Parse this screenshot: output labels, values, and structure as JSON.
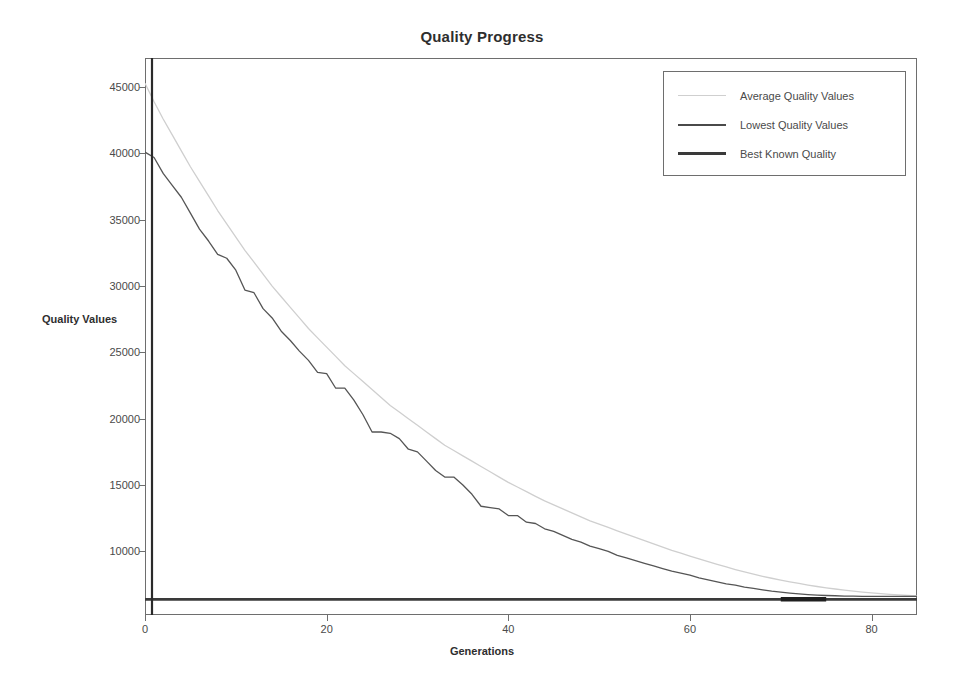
{
  "chart_data": {
    "type": "line",
    "title": "Quality Progress",
    "xlabel": "Generations",
    "ylabel": "Quality Values",
    "xlim": [
      0,
      85
    ],
    "ylim": [
      5200,
      47200
    ],
    "grid": false,
    "legend_position": "top-right",
    "xticks": [
      0,
      20,
      40,
      60,
      80
    ],
    "xtick_labels": [
      "0",
      "20",
      "40",
      "60",
      "80"
    ],
    "yticks": [
      10000,
      15000,
      20000,
      25000,
      30000,
      35000,
      40000,
      45000
    ],
    "ytick_labels": [
      "10000",
      "15000",
      "20000",
      "25000",
      "30000",
      "35000",
      "40000",
      "45000"
    ],
    "x": [
      0,
      1,
      2,
      3,
      4,
      5,
      6,
      7,
      8,
      9,
      10,
      11,
      12,
      13,
      14,
      15,
      16,
      17,
      18,
      19,
      20,
      21,
      22,
      23,
      24,
      25,
      26,
      27,
      28,
      29,
      30,
      31,
      32,
      33,
      34,
      35,
      36,
      37,
      38,
      39,
      40,
      41,
      42,
      43,
      44,
      45,
      46,
      47,
      48,
      49,
      50,
      51,
      52,
      53,
      54,
      55,
      56,
      57,
      58,
      59,
      60,
      61,
      62,
      63,
      64,
      65,
      66,
      67,
      68,
      69,
      70,
      71,
      72,
      73,
      74,
      75,
      76,
      77,
      78,
      79,
      80,
      81,
      82,
      83,
      84,
      85
    ],
    "series": [
      {
        "name": "Average Quality Values",
        "color": "#cfcfcf",
        "width": 1.3,
        "values": [
          45300,
          43900,
          42600,
          41400,
          40200,
          39000,
          37900,
          36800,
          35700,
          34700,
          33700,
          32700,
          31800,
          30900,
          30000,
          29200,
          28400,
          27600,
          26800,
          26100,
          25400,
          24700,
          24000,
          23400,
          22800,
          22200,
          21600,
          21000,
          20500,
          20000,
          19500,
          19000,
          18500,
          18000,
          17600,
          17200,
          16800,
          16400,
          16000,
          15600,
          15200,
          14850,
          14500,
          14150,
          13800,
          13500,
          13200,
          12900,
          12600,
          12300,
          12050,
          11800,
          11550,
          11300,
          11050,
          10800,
          10560,
          10320,
          10080,
          9860,
          9640,
          9430,
          9220,
          9020,
          8820,
          8630,
          8450,
          8280,
          8120,
          7970,
          7830,
          7700,
          7580,
          7460,
          7350,
          7250,
          7160,
          7080,
          7000,
          6930,
          6870,
          6810,
          6760,
          6710,
          6670,
          6640
        ]
      },
      {
        "name": "Lowest Quality Values",
        "color": "#555555",
        "width": 1.3,
        "values": [
          40100,
          39700,
          38500,
          37600,
          36700,
          35500,
          34300,
          33400,
          32400,
          32100,
          31200,
          29700,
          29500,
          28300,
          27600,
          26600,
          25900,
          25100,
          24400,
          23500,
          23400,
          22300,
          22300,
          21400,
          20300,
          19000,
          19000,
          18900,
          18500,
          17700,
          17500,
          16800,
          16100,
          15600,
          15600,
          15000,
          14300,
          13400,
          13300,
          13200,
          12700,
          12700,
          12200,
          12100,
          11700,
          11500,
          11200,
          10900,
          10700,
          10400,
          10200,
          10000,
          9700,
          9500,
          9300,
          9100,
          8900,
          8700,
          8500,
          8350,
          8200,
          8000,
          7850,
          7700,
          7550,
          7450,
          7300,
          7200,
          7100,
          7000,
          6920,
          6850,
          6790,
          6740,
          6700,
          6670,
          6650,
          6630,
          6620,
          6610,
          6600,
          6600,
          6600,
          6600,
          6600,
          6600
        ]
      },
      {
        "name": "Best Known Quality",
        "color": "#3a3a3a",
        "width": 2.6,
        "constant": 6380
      }
    ],
    "highlight_segment": {
      "name": "converged-overlap",
      "x_start": 70,
      "x_end": 75,
      "value": 6380
    }
  },
  "legend": {
    "entries": [
      {
        "label": "Average Quality Values",
        "color": "#cfcfcf",
        "thickness": "1px"
      },
      {
        "label": "Lowest Quality Values",
        "color": "#4a4a4a",
        "thickness": "2px"
      },
      {
        "label": "Best Known Quality",
        "color": "#3a3a3a",
        "thickness": "3px"
      }
    ]
  }
}
